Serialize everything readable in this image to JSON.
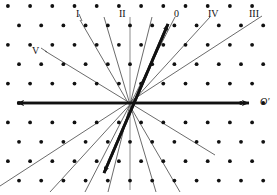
{
  "figure": {
    "background_color": "#ffffff",
    "ink_color": "#111111",
    "thin_line_color": "#3a3a3a",
    "size": {
      "width": 277,
      "height": 195
    },
    "origin": {
      "x": 130,
      "y": 103
    }
  },
  "labels": [
    {
      "id": "label-I",
      "text": "I",
      "x": 76,
      "y": 9,
      "italic": false
    },
    {
      "id": "label-II",
      "text": "II",
      "x": 119,
      "y": 9,
      "italic": false
    },
    {
      "id": "label-0",
      "text": "0",
      "x": 174,
      "y": 9,
      "italic": false
    },
    {
      "id": "label-IV",
      "text": "IV",
      "x": 208,
      "y": 9,
      "italic": false
    },
    {
      "id": "label-III",
      "text": "III",
      "x": 249,
      "y": 9,
      "italic": false
    },
    {
      "id": "label-V",
      "text": "V",
      "x": 32,
      "y": 46,
      "italic": false
    },
    {
      "id": "label-Oprime",
      "text": "O'",
      "x": 260,
      "y": 97,
      "italic": true
    }
  ],
  "axes": [
    {
      "id": "horizontal-axis",
      "name": "horizontal-axis",
      "style": "thick",
      "x1": 10,
      "y1": 103,
      "x2": 256,
      "y2": 103,
      "arrow_start": true,
      "arrow_end": true,
      "label": "O'"
    },
    {
      "id": "diagonal-axis",
      "name": "diagonal-axis",
      "style": "thick",
      "x1": 100,
      "y1": 182,
      "x2": 172,
      "y2": 18,
      "arrow_start": true,
      "arrow_end": true,
      "label": ""
    },
    {
      "id": "vertical-axis",
      "name": "vertical-axis",
      "style": "thin-grey",
      "x1": 130,
      "y1": 17,
      "x2": 130,
      "y2": 190,
      "arrow_start": false,
      "arrow_end": false,
      "label": "II"
    }
  ],
  "zone_lines": [
    {
      "id": "zone-line-I",
      "label": "I",
      "angle_deg": 118,
      "style": "thin"
    },
    {
      "id": "zone-line-II",
      "label": "II",
      "angle_deg": 90,
      "style": "thin"
    },
    {
      "id": "zone-line-0",
      "label": "0",
      "angle_deg": 62,
      "style": "thin"
    },
    {
      "id": "zone-line-IV",
      "label": "IV",
      "angle_deg": 47,
      "style": "thin"
    },
    {
      "id": "zone-line-III",
      "label": "III",
      "angle_deg": 33,
      "style": "thin"
    },
    {
      "id": "zone-line-V",
      "label": "V",
      "angle_deg": 150,
      "style": "thin"
    },
    {
      "id": "zone-line-a",
      "label": "",
      "angle_deg": 75,
      "style": "thin"
    },
    {
      "id": "zone-line-b",
      "label": "",
      "angle_deg": 104,
      "style": "thin"
    }
  ],
  "lattice": {
    "type": "triangular",
    "dot_radius_px": 1.9,
    "dot_color": "#111111",
    "column_spacing_px": 22.2,
    "row_spacing_px": 19.4,
    "row_offset_px": 11.1,
    "columns": 13,
    "rows": 9
  },
  "chart_data": {
    "type": "scatter",
    "xlabel": "",
    "ylabel": "",
    "legend": [
      "I",
      "II",
      "0",
      "IV",
      "III",
      "V"
    ],
    "annotations": [
      "I",
      "II",
      "0",
      "IV",
      "III",
      "V",
      "O'"
    ],
    "grid": false,
    "lattice_spacing": {
      "a": 22.2,
      "b": 19.4,
      "stagger": 11.1
    },
    "line_angles_deg": [
      150,
      118,
      104,
      90,
      75,
      62,
      47,
      33,
      0
    ],
    "series": [
      {
        "name": "lattice-dots",
        "marker": "filled-circle",
        "count": 100
      }
    ]
  }
}
